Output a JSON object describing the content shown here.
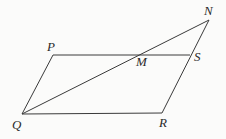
{
  "diagram": {
    "type": "geometry",
    "colors": {
      "line": "#3a3a3a",
      "label": "#2a2a2a",
      "background": "#fbfbfa"
    },
    "points": {
      "P": {
        "label": "P",
        "x": 53,
        "y": 55
      },
      "Q": {
        "label": "Q",
        "x": 22,
        "y": 114
      },
      "R": {
        "label": "R",
        "x": 162,
        "y": 113
      },
      "S": {
        "label": "S",
        "x": 190,
        "y": 55
      },
      "M": {
        "label": "M",
        "x": 138,
        "y": 54
      },
      "N": {
        "label": "N",
        "x": 209,
        "y": 20
      }
    },
    "segments": [
      {
        "from": "P",
        "to": "S"
      },
      {
        "from": "P",
        "to": "Q"
      },
      {
        "from": "Q",
        "to": "R"
      },
      {
        "from": "R",
        "to": "N"
      },
      {
        "from": "Q",
        "to": "N"
      }
    ]
  }
}
